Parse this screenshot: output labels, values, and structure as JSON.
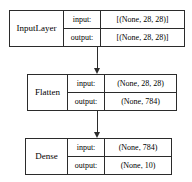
{
  "diagram": {
    "io_labels": {
      "input": "input:",
      "output": "output:"
    },
    "nodes": [
      {
        "id": "input-layer",
        "name": "InputLayer",
        "input_shape": "[(None, 28, 28)]",
        "output_shape": "[(None, 28, 28)]"
      },
      {
        "id": "flatten",
        "name": "Flatten",
        "input_shape": "(None, 28, 28)",
        "output_shape": "(None, 784)"
      },
      {
        "id": "dense",
        "name": "Dense",
        "input_shape": "(None, 784)",
        "output_shape": "(None, 10)"
      }
    ],
    "edges": [
      {
        "id": "edge-input-to-flatten",
        "from": "input-layer",
        "to": "flatten"
      },
      {
        "id": "edge-flatten-to-dense",
        "from": "flatten",
        "to": "dense"
      }
    ],
    "colors": {
      "stroke": "#2b2b2b",
      "background": "#ffffff",
      "text": "#000000"
    }
  }
}
